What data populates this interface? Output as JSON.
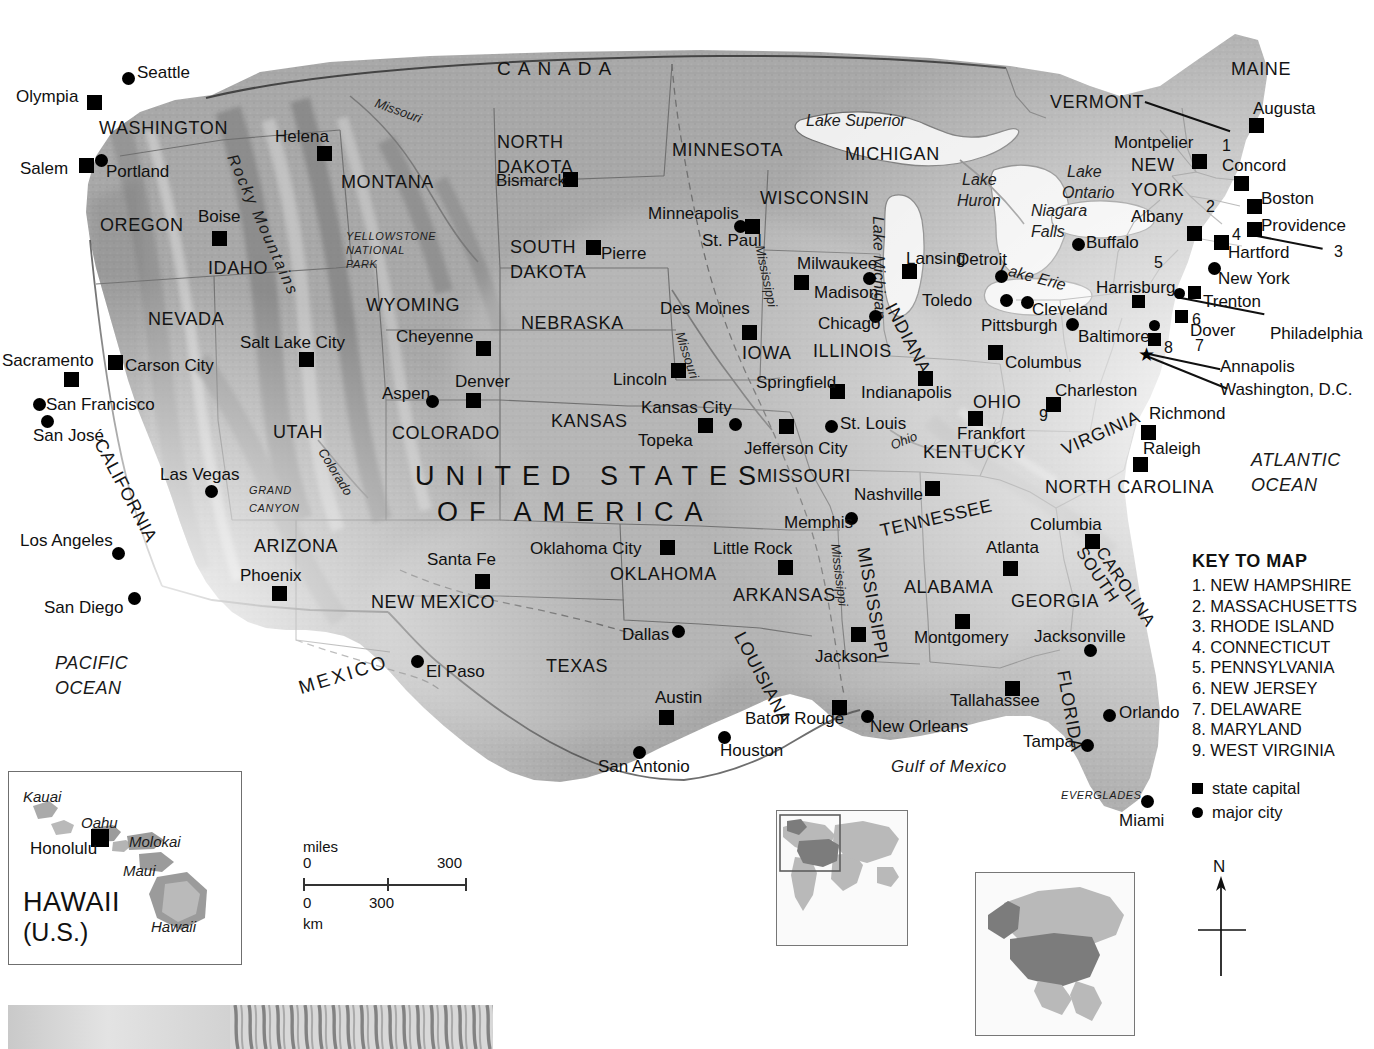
{
  "map": {
    "title": "UNITED STATES OF AMERICA",
    "title_line1": "UNITED STATES",
    "title_line2": "OF AMERICA",
    "neighbors": [
      "CANADA",
      "MEXICO"
    ],
    "oceans": [
      {
        "name": "PACIFIC OCEAN",
        "line1": "PACIFIC",
        "line2": "OCEAN"
      },
      {
        "name": "ATLANTIC OCEAN",
        "line1": "ATLANTIC",
        "line2": "OCEAN"
      },
      {
        "name": "Gulf of Mexico"
      }
    ],
    "lakes": [
      {
        "name": "Lake Superior"
      },
      {
        "name": "Lake Huron",
        "line1": "Lake",
        "line2": "Huron"
      },
      {
        "name": "Lake Michigan"
      },
      {
        "name": "Lake Ontario",
        "line1": "Lake",
        "line2": "Ontario"
      },
      {
        "name": "Lake Erie"
      }
    ],
    "rivers": [
      "Missouri",
      "Mississippi",
      "Colorado",
      "Ohio"
    ],
    "landmarks": [
      {
        "name": "YELLOWSTONE NATIONAL PARK",
        "l1": "YELLOWSTONE",
        "l2": "NATIONAL",
        "l3": "PARK"
      },
      {
        "name": "GRAND CANYON",
        "l1": "GRAND",
        "l2": "CANYON"
      },
      {
        "name": "Rocky Mountains"
      },
      {
        "name": "Niagara Falls",
        "l1": "Niagara",
        "l2": "Falls"
      },
      {
        "name": "EVERGLADES"
      }
    ],
    "states": [
      {
        "name": "WASHINGTON"
      },
      {
        "name": "OREGON"
      },
      {
        "name": "IDAHO"
      },
      {
        "name": "MONTANA"
      },
      {
        "name": "NEVADA"
      },
      {
        "name": "CALIFORNIA"
      },
      {
        "name": "UTAH"
      },
      {
        "name": "ARIZONA"
      },
      {
        "name": "WYOMING"
      },
      {
        "name": "COLORADO"
      },
      {
        "name": "NEW MEXICO"
      },
      {
        "name": "NORTH DAKOTA",
        "l1": "NORTH",
        "l2": "DAKOTA"
      },
      {
        "name": "SOUTH DAKOTA",
        "l1": "SOUTH",
        "l2": "DAKOTA"
      },
      {
        "name": "NEBRASKA"
      },
      {
        "name": "KANSAS"
      },
      {
        "name": "OKLAHOMA"
      },
      {
        "name": "TEXAS"
      },
      {
        "name": "MINNESOTA"
      },
      {
        "name": "IOWA"
      },
      {
        "name": "MISSOURI"
      },
      {
        "name": "ARKANSAS"
      },
      {
        "name": "LOUISIANA"
      },
      {
        "name": "WISCONSIN"
      },
      {
        "name": "ILLINOIS"
      },
      {
        "name": "MICHIGAN"
      },
      {
        "name": "INDIANA"
      },
      {
        "name": "OHIO"
      },
      {
        "name": "KENTUCKY"
      },
      {
        "name": "TENNESSEE"
      },
      {
        "name": "MISSISSIPPI"
      },
      {
        "name": "ALABAMA"
      },
      {
        "name": "GEORGIA"
      },
      {
        "name": "FLORIDA"
      },
      {
        "name": "SOUTH CAROLINA",
        "l1": "SOUTH",
        "l2": "CAROLINA"
      },
      {
        "name": "NORTH CAROLINA"
      },
      {
        "name": "VIRGINIA"
      },
      {
        "name": "NEW YORK",
        "l1": "NEW",
        "l2": "YORK"
      },
      {
        "name": "VERMONT"
      },
      {
        "name": "MAINE"
      }
    ],
    "state_capitals": [
      "Olympia",
      "Salem",
      "Boise",
      "Helena",
      "Carson City",
      "Sacramento",
      "Salt Lake City",
      "Phoenix",
      "Cheyenne",
      "Denver",
      "Santa Fe",
      "Bismarck",
      "Pierre",
      "Lincoln",
      "Topeka",
      "Oklahoma City",
      "Austin",
      "St. Paul",
      "Des Moines",
      "Jefferson City",
      "Little Rock",
      "Baton Rouge",
      "Madison",
      "Springfield",
      "Lansing",
      "Indianapolis",
      "Columbus",
      "Frankfort",
      "Nashville",
      "Jackson",
      "Montgomery",
      "Atlanta",
      "Tallahassee",
      "Columbia",
      "Raleigh",
      "Richmond",
      "Charleston",
      "Annapolis",
      "Dover",
      "Trenton",
      "Harrisburg",
      "Albany",
      "Montpelier",
      "Concord",
      "Augusta",
      "Boston",
      "Providence",
      "Hartford",
      "Honolulu"
    ],
    "major_cities": [
      "Seattle",
      "Portland",
      "San Francisco",
      "San José",
      "Los Angeles",
      "San Diego",
      "Las Vegas",
      "Aspen",
      "El Paso",
      "Dallas",
      "San Antonio",
      "Houston",
      "New Orleans",
      "Memphis",
      "Kansas City",
      "St. Louis",
      "Minneapolis",
      "Milwaukee",
      "Chicago",
      "Detroit",
      "Toledo",
      "Cleveland",
      "Pittsburgh",
      "Buffalo",
      "New York",
      "Philadelphia",
      "Baltimore",
      "Jacksonville",
      "Orlando",
      "Tampa",
      "Miami"
    ],
    "callouts": [
      {
        "label": "VERMONT"
      },
      {
        "label": "Philadelphia"
      },
      {
        "label": "Annapolis"
      },
      {
        "label": "Washington, D.C."
      },
      {
        "label": "3"
      }
    ],
    "numbered_on_map": [
      "1",
      "2",
      "3",
      "4",
      "5",
      "6",
      "7",
      "8",
      "9"
    ]
  },
  "key": {
    "title": "KEY TO MAP",
    "items": [
      "1. NEW HAMPSHIRE",
      "2. MASSACHUSETTS",
      "3. RHODE ISLAND",
      "4. CONNECTICUT",
      "5. PENNSYLVANIA",
      "6. NEW JERSEY",
      "7. DELAWARE",
      "8. MARYLAND",
      "9. WEST VIRGINIA"
    ],
    "legend": [
      {
        "symbol": "square",
        "label": "state capital"
      },
      {
        "symbol": "circle",
        "label": "major city"
      }
    ]
  },
  "compass": {
    "north_label": "N"
  },
  "scale": {
    "miles_label": "miles",
    "km_label": "km",
    "miles_min": "0",
    "miles_max": "300",
    "km_min": "0",
    "km_mid": "300"
  },
  "hawaii_inset": {
    "title_line1": "HAWAII",
    "title_line2": "(U.S.)",
    "islands": [
      "Kauai",
      "Oahu",
      "Molokai",
      "Maui",
      "Hawaii"
    ],
    "capital": "Honolulu"
  },
  "colors": {
    "land": "#a8a8a8",
    "land_light": "#c4c4c4",
    "water": "#ededed",
    "border": "#6d6d6d",
    "text": "#111111",
    "marker": "#000000",
    "inset_highlight": "#7c7c7c",
    "inset_land": "#b9b9b9"
  }
}
